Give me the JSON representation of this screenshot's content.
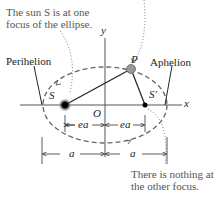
{
  "annotations": {
    "sun_note_line1": "The sun S is at one",
    "sun_note_line2": "focus of the ellipse.",
    "other_focus_line1": "There is nothing at",
    "other_focus_line2": "the other focus."
  },
  "labels": {
    "perihelion": "Perihelion",
    "aphelion": "Aphelion",
    "planet": "P",
    "sun_focus": "S",
    "empty_focus": "S'",
    "origin": "O",
    "x_axis": "x",
    "y_axis": "y",
    "ea_left": "ea",
    "ea_right": "ea",
    "a_left": "a",
    "a_right": "a"
  },
  "colors": {
    "ellipse": "#666666",
    "axes": "#333333",
    "text": "#222222",
    "note": "#555555",
    "planet": "#888888"
  }
}
